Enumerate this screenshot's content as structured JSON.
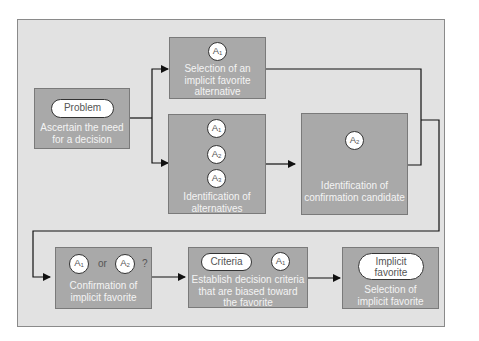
{
  "diagram": {
    "colors": {
      "frame_bg": "#e2e2e2",
      "box_bg": "#a9a9a9",
      "line": "#111111",
      "pill_bg": "#ffffff"
    },
    "nodes": {
      "problem": {
        "pill": "Problem",
        "label_line1": "Ascertain the need",
        "label_line2": "for a decision"
      },
      "selection_implicit": {
        "circle": "A",
        "circle_sub": "1",
        "label_line1": "Selection of an",
        "label_line2": "implicit favorite",
        "label_line3": "alternative"
      },
      "identification_alternatives": {
        "circles": [
          {
            "main": "A",
            "sub": "1"
          },
          {
            "main": "A",
            "sub": "2"
          },
          {
            "main": "A",
            "sub": "3"
          }
        ],
        "label_line1": "Identification of",
        "label_line2": "alternatives"
      },
      "identification_candidate": {
        "circle": "A",
        "circle_sub": "2",
        "label_line1": "Identification of",
        "label_line2": "confirmation candidate"
      },
      "confirmation": {
        "circle1": "A",
        "circle1_sub": "1",
        "or_text": "or",
        "circle2": "A",
        "circle2_sub": "2",
        "question": "?",
        "label_line1": "Confirmation of",
        "label_line2": "implicit favorite"
      },
      "criteria": {
        "pill": "Criteria",
        "circle": "A",
        "circle_sub": "1",
        "label_line1": "Establish decision criteria",
        "label_line2": "that are biased toward",
        "label_line3": "the favorite"
      },
      "final_selection": {
        "pill_line1": "Implicit",
        "pill_line2": "favorite",
        "label_line1": "Selection of",
        "label_line2": "implicit favorite"
      }
    }
  }
}
